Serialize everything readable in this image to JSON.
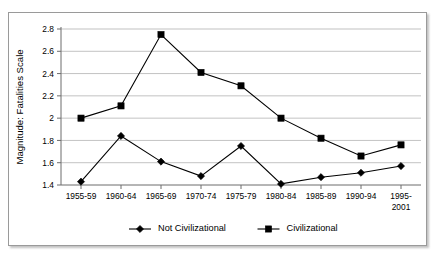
{
  "chart_data": {
    "type": "line",
    "title": "",
    "xlabel": "",
    "ylabel": "Magnitude: Fatalities Scale",
    "categories": [
      "1955-59",
      "1960-64",
      "1965-69",
      "1970-74",
      "1975-79",
      "1980-84",
      "1985-89",
      "1990-94",
      "1995-2001"
    ],
    "category_lines": [
      [
        "1955-59"
      ],
      [
        "1960-64"
      ],
      [
        "1965-69"
      ],
      [
        "1970-74"
      ],
      [
        "1975-79"
      ],
      [
        "1980-84"
      ],
      [
        "1985-89"
      ],
      [
        "1990-94"
      ],
      [
        "1995-",
        "2001"
      ]
    ],
    "ylim": [
      1.4,
      2.8
    ],
    "yticks": [
      1.4,
      1.6,
      1.8,
      2.0,
      2.2,
      2.4,
      2.6,
      2.8
    ],
    "ytick_labels": [
      "1.4",
      "1.6",
      "1.8",
      "2",
      "2.2",
      "2.4",
      "2.6",
      "2.8"
    ],
    "grid": true,
    "legend_position": "bottom",
    "series": [
      {
        "name": "Not Civilizational",
        "marker": "diamond",
        "color": "#000000",
        "values": [
          1.43,
          1.84,
          1.61,
          1.48,
          1.75,
          1.41,
          1.47,
          1.51,
          1.57
        ]
      },
      {
        "name": "Civilizational",
        "marker": "square",
        "color": "#000000",
        "values": [
          2.0,
          2.11,
          2.75,
          2.41,
          2.29,
          2.0,
          1.82,
          1.66,
          1.76
        ]
      }
    ]
  },
  "legend": {
    "entries": [
      {
        "label": "Not Civilizational",
        "marker": "diamond"
      },
      {
        "label": "Civilizational",
        "marker": "square"
      }
    ]
  },
  "colors": {
    "gridline": "#a8a8a8",
    "axis": "#6d6d6d",
    "series": "#000000",
    "frame_border": "#9a9a9a",
    "background": "#ffffff"
  }
}
